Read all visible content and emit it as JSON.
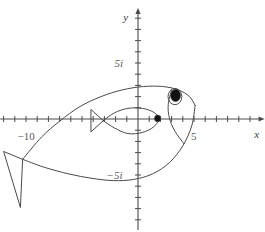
{
  "figure": {
    "title": "",
    "width": 265,
    "height": 232,
    "background": "#ffffff",
    "stroke_color": "#4a4a4a",
    "text_color": "#555555"
  },
  "axes": {
    "x_label": "x",
    "y_label": "y",
    "origin_px": {
      "x": 138,
      "y": 119
    },
    "unit_px": 11.2,
    "x_range": [
      -12.3,
      11.3
    ],
    "y_range": [
      -9.9,
      9.9
    ],
    "x_tick_labels": [
      {
        "value": -10,
        "text": "−10"
      },
      {
        "value": 5,
        "text": "5"
      }
    ],
    "y_tick_labels": [
      {
        "value": 5,
        "text": "5i"
      },
      {
        "value": -5,
        "text": "−5i"
      }
    ],
    "tick_step": 1,
    "tick_len_px": 3,
    "arrow_x": true,
    "arrow_y": true,
    "grid": false
  },
  "chart_data": {
    "type": "line",
    "title": "",
    "xlabel": "x",
    "ylabel": "y",
    "xlim": [
      -12.3,
      11.3
    ],
    "ylim": [
      -9.9,
      9.9
    ],
    "grid": false,
    "legend": "none",
    "annotations": [
      {
        "name": "x-axis-label",
        "text": "x",
        "x": 10.6,
        "y": -1.3
      },
      {
        "name": "y-axis-label",
        "text": "y",
        "x": -1.1,
        "y": 9.1
      },
      {
        "name": "x-tick--10",
        "text": "−10",
        "x": -10,
        "y": -1.5
      },
      {
        "name": "x-tick-5",
        "text": "5",
        "x": 5,
        "y": -1.5
      },
      {
        "name": "y-tick-5i",
        "text": "5i",
        "x": -1.7,
        "y": 5
      },
      {
        "name": "y-tick--5i",
        "text": "−5i",
        "x": -2.1,
        "y": -5
      }
    ],
    "series": [
      {
        "name": "outer-fish-body-upper",
        "comment": "upper back curve from tail joint to snout",
        "x": [
          -10.3,
          -8.6,
          -7.0,
          -5.2,
          -3.3,
          -1.4,
          0.5,
          2.2,
          3.6,
          4.6,
          5.1
        ],
        "y": [
          -3.6,
          -1.6,
          -0.2,
          1.1,
          2.0,
          2.6,
          2.9,
          2.9,
          2.6,
          2.0,
          1.2
        ]
      },
      {
        "name": "outer-fish-body-lower",
        "comment": "belly curve from snout back to tail joint",
        "x": [
          5.1,
          4.8,
          4.0,
          2.8,
          1.3,
          -0.4,
          -2.2,
          -4.1,
          -6.2,
          -8.4,
          -10.3
        ],
        "y": [
          1.2,
          -0.6,
          -2.4,
          -3.9,
          -4.9,
          -5.4,
          -5.5,
          -5.3,
          -4.9,
          -4.3,
          -3.6
        ]
      },
      {
        "name": "outer-fish-tail",
        "comment": "triangular caudal fin",
        "x": [
          -10.3,
          -12.0,
          -10.5,
          -10.3
        ],
        "y": [
          -3.6,
          -2.9,
          -7.9,
          -3.6
        ]
      },
      {
        "name": "gill-curve",
        "comment": "operculum arc behind the head",
        "x": [
          3.0,
          2.7,
          2.8,
          3.3,
          4.1
        ],
        "y": [
          2.6,
          1.3,
          0.1,
          -1.1,
          -2.2
        ]
      },
      {
        "name": "eye-outer",
        "type": "ellipse",
        "center": [
          3.3,
          2.0
        ],
        "rx": 0.62,
        "ry": 0.72,
        "filled": false
      },
      {
        "name": "eye-pupil",
        "type": "ellipse",
        "center": [
          3.35,
          2.1
        ],
        "rx": 0.45,
        "ry": 0.55,
        "filled": true
      },
      {
        "name": "inner-fish-body-upper",
        "x": [
          -3.1,
          -2.1,
          -0.9,
          0.4,
          1.4,
          2.0
        ],
        "y": [
          -0.15,
          0.55,
          0.95,
          0.95,
          0.6,
          0.05
        ]
      },
      {
        "name": "inner-fish-body-lower",
        "x": [
          2.0,
          1.4,
          0.4,
          -0.9,
          -2.1,
          -3.1
        ],
        "y": [
          0.05,
          -0.7,
          -1.2,
          -1.3,
          -0.8,
          -0.15
        ]
      },
      {
        "name": "inner-fish-tail",
        "x": [
          -3.1,
          -4.2,
          -4.2,
          -3.1
        ],
        "y": [
          -0.15,
          0.85,
          -1.15,
          -0.15
        ]
      },
      {
        "name": "inner-fish-eye",
        "type": "ellipse",
        "center": [
          1.75,
          0.05
        ],
        "rx": 0.28,
        "ry": 0.3,
        "filled": true
      }
    ]
  }
}
